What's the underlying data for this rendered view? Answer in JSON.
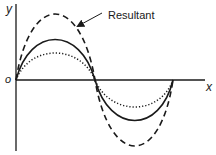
{
  "diagram": {
    "axes": {
      "y_label": "y",
      "x_label": "x",
      "origin_label": "o"
    },
    "annotation": {
      "text": "Resultant",
      "points_to": "dashed-curve"
    },
    "curves": [
      {
        "name": "resultant",
        "style": "dashed",
        "amplitude_px": 66
      },
      {
        "name": "wave-1",
        "style": "solid",
        "amplitude_px": 40
      },
      {
        "name": "wave-2",
        "style": "dotted",
        "amplitude_px": 27
      }
    ],
    "colors": {
      "stroke": "#1a1a1a",
      "background": "#ffffff"
    }
  }
}
